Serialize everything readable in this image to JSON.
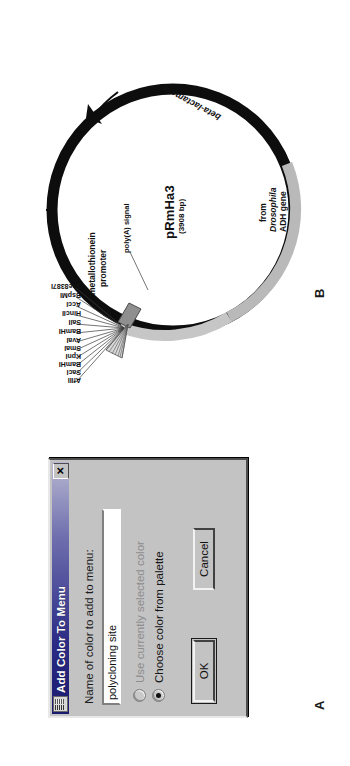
{
  "panels": {
    "a_letter": "A",
    "b_letter": "B"
  },
  "dialog": {
    "title": "Add Color To Menu",
    "icon": "palette-icon",
    "close_label": "✕",
    "field_label": "Name of color to add to menu:",
    "input_value": "polycloning site",
    "input_placeholder": "",
    "radio_options": [
      {
        "label": "Use currently selected color",
        "checked": false,
        "disabled": true
      },
      {
        "label": "Choose color from palette",
        "checked": true,
        "disabled": false
      }
    ],
    "ok_label": "OK",
    "cancel_label": "Cancel"
  },
  "plasmid": {
    "name": "pRmHa3",
    "size": "(3908 bp)",
    "promoter_line1": "metallothionein",
    "promoter_line2": "promoter",
    "polya_signal": "poly(A) signal",
    "adh_line1": "from",
    "adh_line2": "Drosophila",
    "adh_line3": "ADH gene",
    "beta_lactamase": "beta-lactamase",
    "restriction_sites": [
      "AflII",
      "SacI",
      "BamHI",
      "KpnI",
      "SmaI",
      "AvaI",
      "BamHI",
      "SalI",
      "HincII",
      "AccI",
      "BspMI",
      "Sse8387I"
    ],
    "colors": {
      "backbone": "#0d0d0d",
      "insert": "#b9b9b9",
      "promoter_block": "#9a9a9a",
      "background": "#ffffff"
    }
  }
}
